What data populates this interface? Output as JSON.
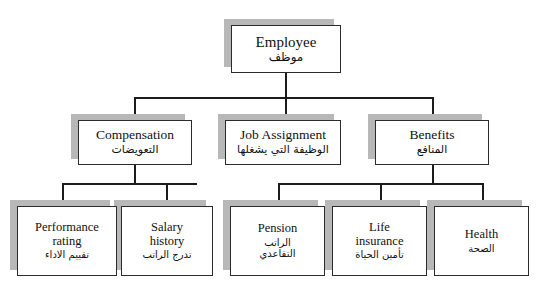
{
  "diagram": {
    "type": "organizational-hierarchy",
    "background_color": "#ffffff",
    "line_color": "#1c1c1c",
    "box_border_color": "#2b2b2b",
    "box_fill_color": "#ffffff",
    "shadow_color": "#b8b8b8",
    "shadow_offset": "up-left"
  },
  "nodes": {
    "employee": {
      "en": "Employee",
      "ar": "موظف"
    },
    "compensation": {
      "en": "Compensation",
      "ar": "التعويضات"
    },
    "job": {
      "en": "Job Assignment",
      "ar": "الوظيفة التي يشغلها"
    },
    "benefits": {
      "en": "Benefits",
      "ar": "المنافع"
    },
    "performance": {
      "en": "Performance\nrating",
      "ar": "تقييم الاداء"
    },
    "salary": {
      "en": "Salary\nhistory",
      "ar": "تدرج الراتب"
    },
    "pension": {
      "en": "Pension",
      "ar": "الراتب\nالتقاعدي"
    },
    "life": {
      "en": "Life\ninsurance",
      "ar": "تأمين الحياة"
    },
    "health": {
      "en": "Health",
      "ar": "الصحة"
    }
  },
  "edges": [
    {
      "from": "employee",
      "to": "compensation"
    },
    {
      "from": "employee",
      "to": "job"
    },
    {
      "from": "employee",
      "to": "benefits"
    },
    {
      "from": "compensation",
      "to": "performance"
    },
    {
      "from": "compensation",
      "to": "salary"
    },
    {
      "from": "benefits",
      "to": "pension"
    },
    {
      "from": "benefits",
      "to": "life"
    },
    {
      "from": "benefits",
      "to": "health"
    }
  ]
}
